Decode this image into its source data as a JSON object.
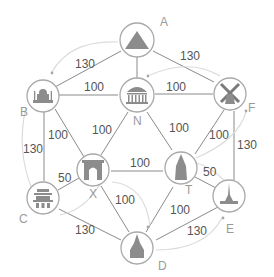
{
  "diagram": {
    "type": "weighted-graph",
    "nodes": [
      {
        "id": "A",
        "label": "A",
        "icon": "pyramid-icon"
      },
      {
        "id": "B",
        "label": "B",
        "icon": "taj-mahal-icon"
      },
      {
        "id": "N",
        "label": "N",
        "icon": "temple-icon"
      },
      {
        "id": "F",
        "label": "F",
        "icon": "windmill-icon"
      },
      {
        "id": "X",
        "label": "X",
        "icon": "arch-icon"
      },
      {
        "id": "T",
        "label": "T",
        "icon": "pagoda-tower-icon"
      },
      {
        "id": "C",
        "label": "C",
        "icon": "chinese-gate-icon"
      },
      {
        "id": "E",
        "label": "E",
        "icon": "eiffel-tower-icon"
      },
      {
        "id": "D",
        "label": "D",
        "icon": "cathedral-icon"
      }
    ],
    "edges": [
      {
        "from": "A",
        "to": "B",
        "weight": "130"
      },
      {
        "from": "A",
        "to": "F",
        "weight": "130"
      },
      {
        "from": "A",
        "to": "N",
        "weight": ""
      },
      {
        "from": "B",
        "to": "N",
        "weight": "100"
      },
      {
        "from": "N",
        "to": "F",
        "weight": "100"
      },
      {
        "from": "B",
        "to": "C",
        "weight": "130"
      },
      {
        "from": "B",
        "to": "X",
        "weight": "100"
      },
      {
        "from": "N",
        "to": "X",
        "weight": "100"
      },
      {
        "from": "N",
        "to": "T",
        "weight": "100"
      },
      {
        "from": "F",
        "to": "T",
        "weight": "100"
      },
      {
        "from": "F",
        "to": "E",
        "weight": "130"
      },
      {
        "from": "X",
        "to": "T",
        "weight": "100"
      },
      {
        "from": "C",
        "to": "X",
        "weight": "50"
      },
      {
        "from": "T",
        "to": "E",
        "weight": "50"
      },
      {
        "from": "X",
        "to": "D",
        "weight": "100"
      },
      {
        "from": "T",
        "to": "D",
        "weight": "100"
      },
      {
        "from": "C",
        "to": "D",
        "weight": "130"
      },
      {
        "from": "D",
        "to": "E",
        "weight": "130"
      }
    ],
    "route_arrows": [
      {
        "from": "A",
        "to": "B"
      },
      {
        "from": "F",
        "to": "N"
      },
      {
        "from": "B",
        "to": "C"
      },
      {
        "from": "C",
        "to": "X"
      },
      {
        "from": "X",
        "to": "D"
      },
      {
        "from": "D",
        "to": "E"
      },
      {
        "from": "E",
        "to": "T"
      },
      {
        "from": "T",
        "to": "F"
      }
    ]
  }
}
